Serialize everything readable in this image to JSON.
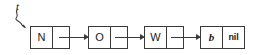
{
  "diagram": {
    "pointer": {
      "label": "t",
      "icon": "wavy-arrow-icon",
      "target": "node-1"
    },
    "colors": {
      "stroke": "#3a3a3a",
      "text": "#1a1a1a",
      "background": "#ffffff"
    },
    "nodes": [
      {
        "data": "N",
        "link": "",
        "italic": false,
        "x": 30,
        "nil": false
      },
      {
        "data": "O",
        "link": "",
        "italic": false,
        "x": 88,
        "nil": false
      },
      {
        "data": "W",
        "link": "",
        "italic": false,
        "x": 144,
        "nil": false
      },
      {
        "data": "b",
        "link": "nil",
        "italic": true,
        "x": 200,
        "nil": true
      }
    ],
    "arrows": [
      {
        "from": "node-1",
        "to": "node-2",
        "x": 59,
        "width": 29
      },
      {
        "from": "node-2",
        "to": "node-3",
        "x": 115,
        "width": 29
      },
      {
        "from": "node-3",
        "to": "node-4",
        "x": 171,
        "width": 29
      }
    ]
  }
}
